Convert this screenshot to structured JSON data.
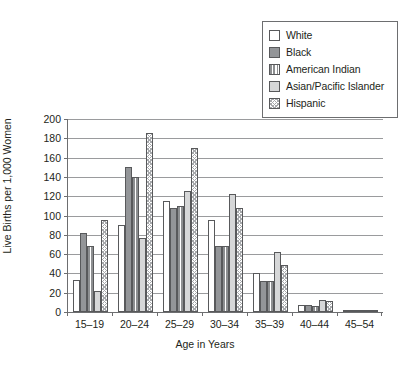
{
  "chart_data": {
    "type": "bar",
    "title": "",
    "xlabel": "Age in Years",
    "ylabel": "Live Births per 1,000 Women",
    "categories": [
      "15–19",
      "20–24",
      "25–29",
      "30–34",
      "35–39",
      "40–44",
      "45–54"
    ],
    "ylim": [
      0,
      200
    ],
    "yticks": [
      0,
      20,
      40,
      60,
      80,
      100,
      120,
      140,
      160,
      180,
      200
    ],
    "grid": true,
    "legend_position": "top-right",
    "series": [
      {
        "name": "White",
        "swatch": "fill-white",
        "values": [
          33,
          90,
          115,
          95,
          40,
          7,
          1
        ]
      },
      {
        "name": "Black",
        "swatch": "fill-solid-gray",
        "values": [
          82,
          150,
          108,
          68,
          32,
          7,
          1
        ]
      },
      {
        "name": "American Indian",
        "swatch": "fill-vstripe",
        "values": [
          68,
          140,
          110,
          68,
          32,
          6,
          1
        ]
      },
      {
        "name": "Asian/Pacific Islander",
        "swatch": "fill-light-gray",
        "values": [
          22,
          77,
          125,
          122,
          62,
          12,
          1
        ]
      },
      {
        "name": "Hispanic",
        "swatch": "fill-hatch",
        "values": [
          95,
          185,
          170,
          108,
          49,
          11,
          1
        ]
      }
    ]
  },
  "colors": {
    "frame": "#6d6e70",
    "gridline": "#9a9b9d",
    "bar_outline": "#58595b",
    "solid_gray": "#939598",
    "light_gray": "#d6d7d8",
    "background": "#ffffff"
  }
}
